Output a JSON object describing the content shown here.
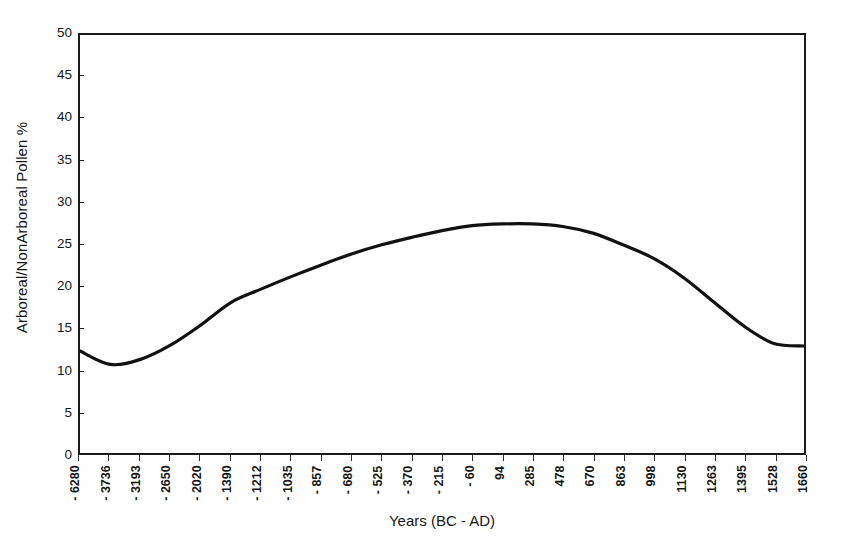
{
  "chart_data": {
    "type": "line",
    "title": "",
    "subtitle": "",
    "xlabel": "Years (BC - AD)",
    "ylabel": "Arboreal/NonArboreal Pollen %",
    "ylim": [
      0,
      50
    ],
    "y_ticks": [
      0,
      5,
      10,
      15,
      20,
      25,
      30,
      35,
      40,
      45,
      50
    ],
    "y_tick_labels": [
      "0",
      "5",
      "10",
      "15",
      "20",
      "25",
      "30",
      "35",
      "40",
      "45",
      "50"
    ],
    "grid": false,
    "legend": null,
    "legend_position": "none",
    "line_color": "#111111",
    "line_width": 3.2,
    "categories": [
      "- 6280",
      "- 3736",
      "- 3193",
      "- 2650",
      "- 2020",
      "- 1390",
      "- 1212",
      "- 1035",
      "- 857",
      "- 680",
      "- 525",
      "- 370",
      "- 215",
      "- 60",
      "94",
      "285",
      "478",
      "670",
      "863",
      "998",
      "1130",
      "1263",
      "1395",
      "1528",
      "1660"
    ],
    "x_values": [
      -6280,
      -3736,
      -3193,
      -2650,
      -2020,
      -1390,
      -1212,
      -1035,
      -857,
      -680,
      -525,
      -370,
      -215,
      -60,
      94,
      285,
      478,
      670,
      863,
      998,
      1130,
      1263,
      1395,
      1528,
      1660
    ],
    "values": [
      12.2,
      10.6,
      11.2,
      12.9,
      15.3,
      18.0,
      19.6,
      21.1,
      22.5,
      23.8,
      24.9,
      25.8,
      26.6,
      27.2,
      27.4,
      27.4,
      27.1,
      26.3,
      24.9,
      23.3,
      21.0,
      18.1,
      15.2,
      13.1,
      12.8
    ],
    "series": [
      {
        "name": "Arboreal/NonArboreal Pollen %",
        "values": [
          12.2,
          10.6,
          11.2,
          12.9,
          15.3,
          18.0,
          19.6,
          21.1,
          22.5,
          23.8,
          24.9,
          25.8,
          26.6,
          27.2,
          27.4,
          27.4,
          27.1,
          26.3,
          24.9,
          23.3,
          21.0,
          18.1,
          15.2,
          13.1,
          12.8
        ]
      }
    ],
    "annotations": []
  }
}
